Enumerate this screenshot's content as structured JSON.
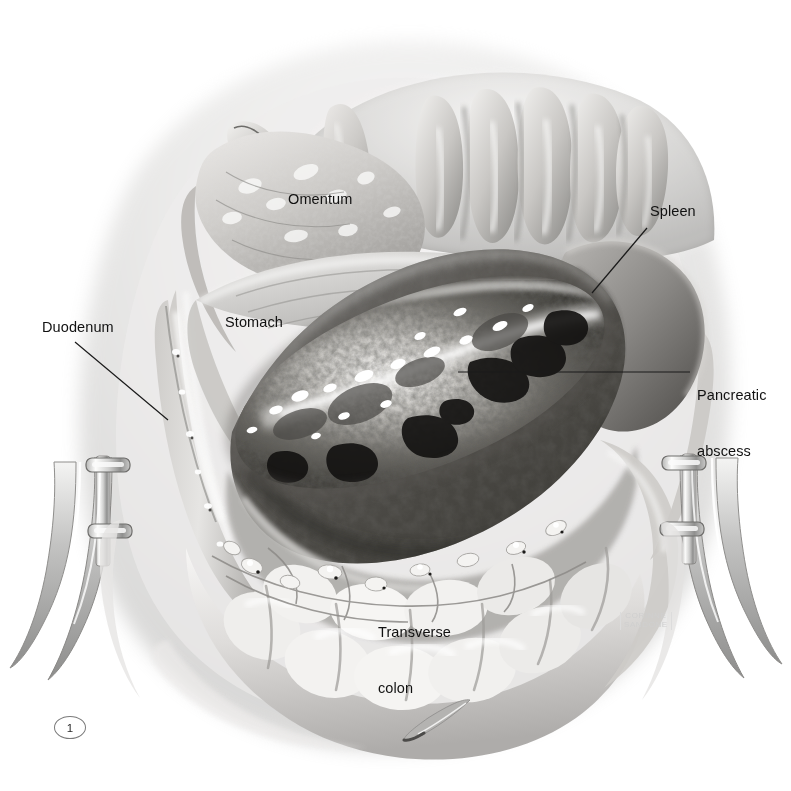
{
  "figure": {
    "domain": "medical-illustration",
    "number": "1",
    "background_color": "#ffffff",
    "ink_color": "#111111",
    "medium": "grayscale airbrush / carbon dust medical illustration",
    "signature": {
      "line1": "CORINNE",
      "line2": "SANDONE",
      "color": "#cfcfcf"
    }
  },
  "labels": [
    {
      "id": "omentum",
      "text": "Omentum",
      "x": 288,
      "y": 190,
      "leader": false
    },
    {
      "id": "spleen",
      "text": "Spleen",
      "x": 650,
      "y": 202,
      "leader": true,
      "leader_from": [
        647,
        228
      ],
      "leader_to": [
        592,
        293
      ]
    },
    {
      "id": "duodenum",
      "text": "Duodenum",
      "x": 42,
      "y": 318,
      "leader": true,
      "leader_from": [
        75,
        342
      ],
      "leader_to": [
        168,
        420
      ]
    },
    {
      "id": "stomach",
      "text": "Stomach",
      "x": 225,
      "y": 313,
      "leader": false
    },
    {
      "id": "pancreatic-abscess",
      "line1": "Pancreatic",
      "line2": "abscess",
      "x": 697,
      "y": 349,
      "leader": true,
      "leader_from": [
        690,
        372
      ],
      "leader_to": [
        458,
        372
      ]
    },
    {
      "id": "transverse-colon",
      "line1": "Transverse",
      "line2": "colon",
      "x": 378,
      "y": 586,
      "leader": false
    }
  ],
  "label_text": {
    "omentum": "Omentum",
    "spleen": "Spleen",
    "duodenum": "Duodenum",
    "stomach": "Stomach",
    "pancreatic_line1": "Pancreatic",
    "pancreatic_line2": "abscess",
    "transverse_line1": "Transverse",
    "transverse_line2": "colon"
  },
  "anatomy_structures": [
    "abdominal wall with retracted tissue folds",
    "greater omentum",
    "stomach posterior wall",
    "duodenum",
    "spleen",
    "pancreatic abscess cavity with necrotic debris",
    "transverse colon with mesocolic vessels"
  ],
  "instruments": [
    {
      "name": "left retractor blade",
      "side": "left",
      "clamps": 2
    },
    {
      "name": "right retractor blade",
      "side": "right",
      "clamps": 2
    },
    {
      "name": "probe tip",
      "side": "bottom"
    }
  ],
  "palette": {
    "background": "#ffffff",
    "tissue_light": "#e4e3e1",
    "tissue_mid": "#bdbcba",
    "tissue_shadow": "#8d8c8a",
    "cavity_dark": "#4a4947",
    "necrotic_black": "#1d1c1b",
    "highlight": "#fbfbfa",
    "metal_light": "#efefee",
    "metal_shadow": "#9b9b9a",
    "leader_line": "#1a1a1a"
  }
}
